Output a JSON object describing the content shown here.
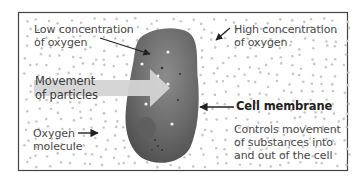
{
  "diagram": {
    "colors": {
      "background": "#ffffff",
      "frame": "#444444",
      "dots": "#c4c4c4",
      "cell_outer": "#5a5a5a",
      "cell_inner": "#8a8a8a",
      "arrow_fill": "#d2d2d2",
      "text": "#4a4a4a"
    },
    "labels": {
      "low_concentration": [
        "Low concentration",
        "of oxygen"
      ],
      "high_concentration": [
        "High concentration",
        "of oxygen"
      ],
      "movement": [
        "Movement",
        "of particles"
      ],
      "oxygen_molecule": [
        "Oxygen",
        "molecule"
      ],
      "cell_membrane": "Cell membrane",
      "membrane_description": [
        "Controls movement",
        "of substances into",
        "and out of the cell"
      ]
    }
  }
}
